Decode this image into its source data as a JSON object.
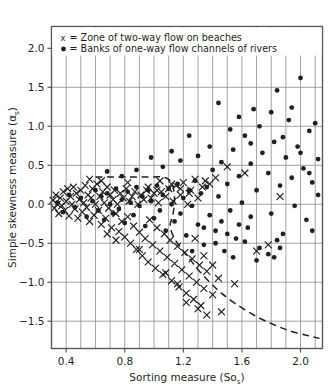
{
  "chart_data": {
    "type": "scatter",
    "title": "",
    "xlabel": "Sorting measure (Sos)",
    "xlabel_main": "Sorting measure (So",
    "xlabel_sub": "s",
    "xlabel_tail": ")",
    "ylabel": "Simple skewness measure (αs)",
    "ylabel_main": "Simple skewness measure (α",
    "ylabel_sub": "s",
    "ylabel_tail": ")",
    "xlim": [
      0.3,
      2.15
    ],
    "ylim": [
      -1.85,
      2.28
    ],
    "xticks": [
      0.4,
      0.8,
      1.2,
      1.6,
      2.0
    ],
    "xtick_labels": [
      "0.4",
      "0.8",
      "1.2",
      "1.6",
      "2.0"
    ],
    "yticks": [
      -1.5,
      -1.0,
      -0.5,
      0.0,
      0.5,
      1.0,
      1.5,
      2.0
    ],
    "ytick_labels": [
      "-1.5",
      "-1.0",
      "-0.5",
      "0.0",
      "0.5",
      "1.0",
      "1.5",
      "2.0"
    ],
    "grid": true,
    "grid_x_step": 0.1,
    "grid_y_step": 0.5,
    "legend_position": "top-left-inside",
    "legend": [
      {
        "marker": "x",
        "label": "= Zone of two-way flow on beaches",
        "key": "x"
      },
      {
        "marker": "dot",
        "label": "= Banks of one-way flow channels of rivers",
        "key": "•"
      }
    ],
    "series": [
      {
        "name": "Zone of two-way flow on beaches",
        "marker": "x",
        "color": "#231f20",
        "points": [
          [
            0.31,
            0.05
          ],
          [
            0.32,
            -0.05
          ],
          [
            0.33,
            0.12
          ],
          [
            0.34,
            0.0
          ],
          [
            0.35,
            -0.12
          ],
          [
            0.36,
            0.08
          ],
          [
            0.37,
            -0.02
          ],
          [
            0.38,
            0.16
          ],
          [
            0.39,
            -0.08
          ],
          [
            0.4,
            0.04
          ],
          [
            0.41,
            0.2
          ],
          [
            0.42,
            -0.15
          ],
          [
            0.43,
            0.1
          ],
          [
            0.44,
            0.0
          ],
          [
            0.45,
            0.22
          ],
          [
            0.46,
            -0.06
          ],
          [
            0.47,
            0.14
          ],
          [
            0.48,
            -0.18
          ],
          [
            0.49,
            0.06
          ],
          [
            0.5,
            0.18
          ],
          [
            0.51,
            -0.1
          ],
          [
            0.52,
            0.02
          ],
          [
            0.53,
            0.24
          ],
          [
            0.54,
            -0.04
          ],
          [
            0.55,
            0.12
          ],
          [
            0.56,
            -0.22
          ],
          [
            0.57,
            0.08
          ],
          [
            0.58,
            0.2
          ],
          [
            0.59,
            -0.14
          ],
          [
            0.6,
            0.0
          ],
          [
            0.61,
            0.26
          ],
          [
            0.62,
            -0.08
          ],
          [
            0.63,
            0.1
          ],
          [
            0.64,
            -0.26
          ],
          [
            0.65,
            0.16
          ],
          [
            0.66,
            0.02
          ],
          [
            0.67,
            -0.18
          ],
          [
            0.68,
            0.22
          ],
          [
            0.69,
            -0.05
          ],
          [
            0.7,
            0.12
          ],
          [
            0.71,
            -0.3
          ],
          [
            0.72,
            0.06
          ],
          [
            0.73,
            0.18
          ],
          [
            0.74,
            -0.12
          ],
          [
            0.75,
            0.0
          ],
          [
            0.76,
            -0.35
          ],
          [
            0.77,
            0.14
          ],
          [
            0.78,
            -0.22
          ],
          [
            0.79,
            0.08
          ],
          [
            0.8,
            -0.42
          ],
          [
            0.81,
            0.2
          ],
          [
            0.82,
            -0.16
          ],
          [
            0.83,
            0.04
          ],
          [
            0.84,
            -0.5
          ],
          [
            0.85,
            0.1
          ],
          [
            0.86,
            -0.28
          ],
          [
            0.87,
            0.16
          ],
          [
            0.88,
            -0.58
          ],
          [
            0.89,
            0.0
          ],
          [
            0.9,
            -0.36
          ],
          [
            0.91,
            0.12
          ],
          [
            0.92,
            -0.66
          ],
          [
            0.93,
            0.06
          ],
          [
            0.94,
            -0.44
          ],
          [
            0.95,
            0.18
          ],
          [
            0.96,
            -0.74
          ],
          [
            0.97,
            -0.2
          ],
          [
            0.98,
            0.08
          ],
          [
            0.99,
            -0.52
          ],
          [
            1.0,
            0.14
          ],
          [
            1.01,
            -0.82
          ],
          [
            1.02,
            -0.3
          ],
          [
            1.03,
            0.02
          ],
          [
            1.04,
            -0.6
          ],
          [
            1.05,
            0.16
          ],
          [
            1.06,
            -0.9
          ],
          [
            1.07,
            -0.38
          ],
          [
            1.08,
            0.1
          ],
          [
            1.09,
            -0.68
          ],
          [
            1.1,
            0.2
          ],
          [
            1.11,
            -0.46
          ],
          [
            1.12,
            -0.98
          ],
          [
            1.13,
            0.04
          ],
          [
            1.14,
            -0.76
          ],
          [
            1.15,
            0.24
          ],
          [
            1.16,
            -0.54
          ],
          [
            1.17,
            -1.06
          ],
          [
            1.18,
            0.12
          ],
          [
            1.19,
            -0.84
          ],
          [
            1.2,
            0.28
          ],
          [
            1.21,
            -0.62
          ],
          [
            1.22,
            -1.14
          ],
          [
            1.23,
            0.0
          ],
          [
            1.24,
            -0.92
          ],
          [
            1.25,
            0.18
          ],
          [
            1.26,
            -0.7
          ],
          [
            1.27,
            -1.22
          ],
          [
            1.28,
            0.32
          ],
          [
            1.29,
            -1.0
          ],
          [
            1.3,
            0.08
          ],
          [
            1.31,
            -0.78
          ],
          [
            1.32,
            -1.3
          ],
          [
            1.33,
            0.22
          ],
          [
            1.34,
            -1.08
          ],
          [
            1.35,
            0.3
          ],
          [
            1.36,
            -0.86
          ],
          [
            1.38,
            0.26
          ],
          [
            1.4,
            -1.16
          ],
          [
            1.42,
            0.34
          ],
          [
            1.44,
            -0.95
          ],
          [
            1.46,
            -1.38
          ],
          [
            1.5,
            0.48
          ],
          [
            1.55,
            -1.02
          ],
          [
            1.62,
            0.4
          ],
          [
            1.7,
            -0.6
          ],
          [
            1.78,
            -0.52
          ],
          [
            1.86,
            0.1
          ],
          [
            0.64,
            0.3
          ],
          [
            0.82,
            0.28
          ],
          [
            1.04,
            0.3
          ],
          [
            1.12,
            0.26
          ],
          [
            1.18,
            0.2
          ],
          [
            1.24,
            0.14
          ],
          [
            0.74,
            -0.46
          ],
          [
            0.9,
            -0.58
          ],
          [
            1.08,
            -0.88
          ],
          [
            1.16,
            -1.02
          ],
          [
            1.22,
            -1.26
          ],
          [
            1.3,
            -1.34
          ],
          [
            1.36,
            -1.42
          ],
          [
            0.56,
            0.32
          ],
          [
            0.68,
            -0.38
          ],
          [
            0.96,
            0.22
          ],
          [
            1.02,
            0.18
          ],
          [
            1.28,
            -0.44
          ],
          [
            1.34,
            -0.66
          ],
          [
            1.4,
            -0.78
          ]
        ]
      },
      {
        "name": "Banks of one-way flow channels of rivers",
        "marker": "dot",
        "color": "#231f20",
        "points": [
          [
            0.34,
            0.02
          ],
          [
            0.38,
            -0.1
          ],
          [
            0.42,
            0.12
          ],
          [
            0.46,
            -0.04
          ],
          [
            0.5,
            0.08
          ],
          [
            0.54,
            -0.16
          ],
          [
            0.58,
            0.04
          ],
          [
            0.6,
            0.18
          ],
          [
            0.62,
            -0.08
          ],
          [
            0.64,
            0.1
          ],
          [
            0.66,
            -0.2
          ],
          [
            0.68,
            0.14
          ],
          [
            0.7,
            0.0
          ],
          [
            0.72,
            -0.12
          ],
          [
            0.74,
            0.2
          ],
          [
            0.76,
            -0.06
          ],
          [
            0.78,
            0.06
          ],
          [
            0.8,
            -0.24
          ],
          [
            0.82,
            0.16
          ],
          [
            0.84,
            0.02
          ],
          [
            0.86,
            -0.14
          ],
          [
            0.88,
            0.22
          ],
          [
            0.9,
            -0.02
          ],
          [
            0.92,
            0.1
          ],
          [
            0.94,
            -0.28
          ],
          [
            0.96,
            0.18
          ],
          [
            0.98,
            0.04
          ],
          [
            1.0,
            -0.18
          ],
          [
            1.02,
            0.24
          ],
          [
            1.04,
            -0.08
          ],
          [
            1.06,
            0.12
          ],
          [
            1.08,
            -0.34
          ],
          [
            1.1,
            0.2
          ],
          [
            1.12,
            0.0
          ],
          [
            1.14,
            -0.22
          ],
          [
            1.16,
            0.26
          ],
          [
            1.18,
            -0.12
          ],
          [
            1.2,
            0.08
          ],
          [
            1.22,
            -0.4
          ],
          [
            1.24,
            0.18
          ],
          [
            1.26,
            -0.02
          ],
          [
            1.28,
            0.3
          ],
          [
            1.3,
            -0.26
          ],
          [
            1.32,
            0.14
          ],
          [
            1.34,
            -0.52
          ],
          [
            1.36,
            0.22
          ],
          [
            1.38,
            -0.14
          ],
          [
            1.4,
            0.44
          ],
          [
            1.42,
            -0.34
          ],
          [
            1.44,
            0.1
          ],
          [
            1.46,
            0.54
          ],
          [
            1.48,
            -0.6
          ],
          [
            1.5,
            0.26
          ],
          [
            1.52,
            -0.08
          ],
          [
            1.54,
            0.7
          ],
          [
            1.56,
            -0.44
          ],
          [
            1.58,
            0.36
          ],
          [
            1.6,
            0.02
          ],
          [
            1.62,
            0.88
          ],
          [
            1.64,
            -0.3
          ],
          [
            1.66,
            0.52
          ],
          [
            1.68,
            1.22
          ],
          [
            1.7,
            0.18
          ],
          [
            1.72,
            -0.56
          ],
          [
            1.74,
            0.66
          ],
          [
            1.76,
            1.94
          ],
          [
            1.78,
            0.4
          ],
          [
            1.8,
            -0.12
          ],
          [
            1.82,
            0.8
          ],
          [
            1.84,
            1.46
          ],
          [
            1.86,
            0.24
          ],
          [
            1.88,
            -0.38
          ],
          [
            1.9,
            0.6
          ],
          [
            1.92,
            1.08
          ],
          [
            1.94,
            0.34
          ],
          [
            1.96,
            -0.02
          ],
          [
            1.98,
            0.74
          ],
          [
            2.0,
            1.62
          ],
          [
            2.02,
            0.46
          ],
          [
            2.04,
            -0.2
          ],
          [
            2.06,
            0.94
          ],
          [
            2.08,
            0.28
          ],
          [
            2.1,
            1.04
          ],
          [
            2.12,
            0.58
          ],
          [
            1.44,
            1.3
          ],
          [
            1.52,
            0.96
          ],
          [
            1.58,
            1.12
          ],
          [
            1.66,
            0.78
          ],
          [
            1.72,
            1.0
          ],
          [
            1.8,
            1.18
          ],
          [
            1.88,
            0.86
          ],
          [
            1.94,
            1.24
          ],
          [
            2.0,
            0.66
          ],
          [
            2.06,
            0.4
          ],
          [
            1.3,
            0.62
          ],
          [
            1.38,
            0.74
          ],
          [
            1.46,
            -0.22
          ],
          [
            1.54,
            -0.68
          ],
          [
            1.62,
            -0.48
          ],
          [
            1.7,
            -0.72
          ],
          [
            1.78,
            -0.64
          ],
          [
            1.86,
            -0.56
          ],
          [
            1.82,
            -0.68
          ],
          [
            1.84,
            -0.46
          ],
          [
            1.24,
            0.88
          ],
          [
            1.18,
            0.56
          ],
          [
            1.12,
            0.68
          ],
          [
            1.06,
            0.48
          ],
          [
            0.98,
            0.6
          ],
          [
            0.88,
            0.44
          ],
          [
            0.78,
            0.36
          ],
          [
            0.68,
            0.42
          ],
          [
            1.58,
            -0.26
          ],
          [
            1.66,
            -0.16
          ],
          [
            1.5,
            -0.38
          ],
          [
            1.42,
            -0.5
          ],
          [
            1.34,
            -0.3
          ],
          [
            1.26,
            -0.6
          ],
          [
            2.08,
            -0.34
          ],
          [
            2.12,
            0.12
          ]
        ]
      }
    ],
    "envelope": {
      "description": "dashed boundary enclosing the zone of two-way flow on beaches",
      "style": "dashed",
      "color": "#231f20",
      "path": [
        [
          0.6,
          0.35
        ],
        [
          0.72,
          0.35
        ],
        [
          0.84,
          0.35
        ],
        [
          0.96,
          0.35
        ],
        [
          1.05,
          0.35
        ],
        [
          1.1,
          0.32
        ],
        [
          1.13,
          0.22
        ],
        [
          1.14,
          0.05
        ],
        [
          1.13,
          -0.12
        ],
        [
          1.11,
          -0.28
        ],
        [
          1.14,
          -0.44
        ],
        [
          1.19,
          -0.58
        ],
        [
          1.25,
          -0.72
        ],
        [
          1.31,
          -0.86
        ],
        [
          1.38,
          -1.0
        ],
        [
          1.46,
          -1.14
        ],
        [
          1.56,
          -1.28
        ],
        [
          1.68,
          -1.42
        ],
        [
          1.8,
          -1.53
        ],
        [
          1.92,
          -1.62
        ],
        [
          2.04,
          -1.68
        ],
        [
          2.13,
          -1.72
        ]
      ]
    }
  }
}
